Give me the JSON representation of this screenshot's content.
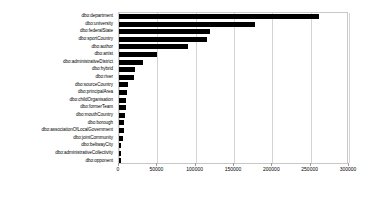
{
  "chart_data": {
    "type": "bar",
    "orientation": "horizontal",
    "title": "",
    "subtitle": "",
    "xlabel": "",
    "ylabel": "",
    "xlim": [
      0,
      300000
    ],
    "ylim": null,
    "grid": true,
    "grid_axis": "x",
    "legend": false,
    "legend_position": "none",
    "bar_color": "#000000",
    "background_color": "#ffffff",
    "categories": [
      "dbo:department",
      "dbo:university",
      "dbo:federalState",
      "dbo:sportCountry",
      "dbo:author",
      "dbo:artist",
      "dbo:administrativeDistrict",
      "dbo:hybrid",
      "dbo:river",
      "dbo:sourceCountry",
      "dbo:principalArea",
      "dbo:childOrganisation",
      "dbo:formerTeam",
      "dbo:mouthCountry",
      "dbo:borough",
      "dbo:associationOfLocalGovernment",
      "dbo:jointCommunity",
      "dbo:beltwayCity",
      "dbo:administrativeCollectivity",
      "dbo:opponent"
    ],
    "values": [
      261000,
      177000,
      119000,
      115000,
      90000,
      50000,
      31000,
      21000,
      19000,
      12000,
      11000,
      9000,
      8500,
      8000,
      7000,
      6500,
      5500,
      3000,
      2500,
      2000
    ],
    "xticks": [
      0,
      50000,
      100000,
      150000,
      200000,
      250000,
      300000
    ],
    "xticklabels": [
      "0",
      "50000",
      "100000",
      "150000",
      "200000",
      "250000",
      "300000"
    ]
  }
}
